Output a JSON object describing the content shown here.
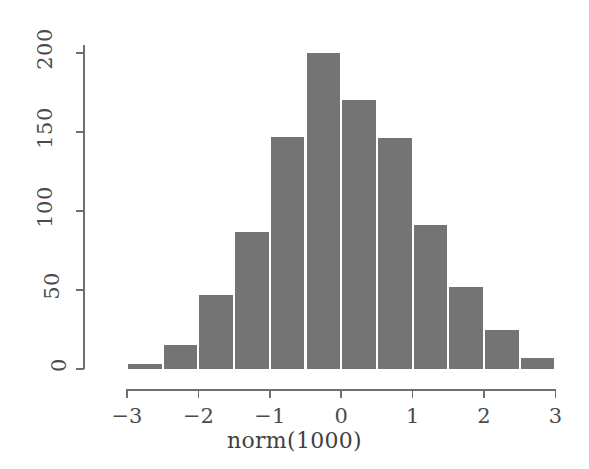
{
  "chart_data": {
    "type": "bar",
    "title": "",
    "subtitle": "",
    "xlabel": "norm(1000)",
    "ylabel": "",
    "xlim": [
      -3.25,
      3.0
    ],
    "ylim": [
      0,
      205
    ],
    "grid": false,
    "legend": false,
    "bin_width": 0.5,
    "bin_edges": [
      -3.0,
      -2.5,
      -2.0,
      -1.5,
      -1.0,
      -0.5,
      0.0,
      0.5,
      1.0,
      1.5,
      2.0,
      2.5,
      3.0
    ],
    "categories": [
      "-3.0 to -2.5",
      "-2.5 to -2.0",
      "-2.0 to -1.5",
      "-1.5 to -1.0",
      "-1.0 to -0.5",
      "-0.5 to 0.0",
      "0.0 to 0.5",
      "0.5 to 1.0",
      "1.0 to 1.5",
      "1.5 to 2.0",
      "2.0 to 2.5",
      "2.5 to 3.0"
    ],
    "values": [
      3,
      15,
      47,
      87,
      147,
      200,
      170,
      146,
      91,
      52,
      25,
      7
    ],
    "bar_color": "#757475",
    "bar_border_color": "#ffffff",
    "axis_color": "#6f6f6f",
    "background_color": "#ffffff"
  },
  "axes": {
    "y": {
      "ticks": [
        0,
        50,
        100,
        150,
        200
      ],
      "tick_labels": [
        "0",
        "50",
        "100",
        "150",
        "200"
      ],
      "min": 0,
      "max": 205
    },
    "x": {
      "ticks": [
        -3,
        -2,
        -1,
        0,
        1,
        2,
        3
      ],
      "tick_labels": [
        "−3",
        "−2",
        "−1",
        "0",
        "1",
        "2",
        "3"
      ],
      "min": -3.25,
      "max": 3.0
    }
  },
  "labels": {
    "x_axis_title": "norm(1000)"
  }
}
